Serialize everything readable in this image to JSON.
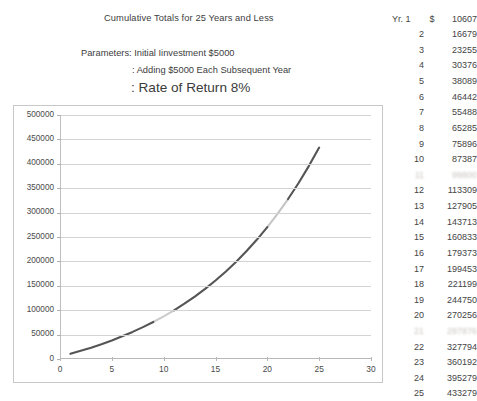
{
  "header": {
    "title": "Cumulative Totals for 25 Years and Less",
    "param_line_1": "Parameters: Initial Iinvestment $5000",
    "param_line_2": ": Adding $5000 Each Subsequent Year",
    "param_line_3": ": Rate of Return 8%"
  },
  "table": {
    "year_label": "Yr. 1",
    "currency_symbol": "$",
    "rows": [
      {
        "year": "1",
        "value": "10607",
        "blurred": false
      },
      {
        "year": "2",
        "value": "16679",
        "blurred": false
      },
      {
        "year": "3",
        "value": "23255",
        "blurred": false
      },
      {
        "year": "4",
        "value": "30376",
        "blurred": false
      },
      {
        "year": "5",
        "value": "38089",
        "blurred": false
      },
      {
        "year": "6",
        "value": "46442",
        "blurred": false
      },
      {
        "year": "7",
        "value": "55488",
        "blurred": false
      },
      {
        "year": "8",
        "value": "65285",
        "blurred": false
      },
      {
        "year": "9",
        "value": "75896",
        "blurred": false
      },
      {
        "year": "10",
        "value": "87387",
        "blurred": false
      },
      {
        "year": "11",
        "value": "99800",
        "blurred": true
      },
      {
        "year": "12",
        "value": "113309",
        "blurred": false
      },
      {
        "year": "13",
        "value": "127905",
        "blurred": false
      },
      {
        "year": "14",
        "value": "143713",
        "blurred": false
      },
      {
        "year": "15",
        "value": "160833",
        "blurred": false
      },
      {
        "year": "16",
        "value": "179373",
        "blurred": false
      },
      {
        "year": "17",
        "value": "199453",
        "blurred": false
      },
      {
        "year": "18",
        "value": "221199",
        "blurred": false
      },
      {
        "year": "19",
        "value": "244750",
        "blurred": false
      },
      {
        "year": "20",
        "value": "270256",
        "blurred": false
      },
      {
        "year": "21",
        "value": "297876",
        "blurred": true
      },
      {
        "year": "22",
        "value": "327794",
        "blurred": false
      },
      {
        "year": "23",
        "value": "360192",
        "blurred": false
      },
      {
        "year": "24",
        "value": "395279",
        "blurred": false
      },
      {
        "year": "25",
        "value": "433279",
        "blurred": false
      }
    ]
  },
  "chart_data": {
    "type": "line",
    "title": "",
    "xlabel": "",
    "ylabel": "",
    "xlim": [
      0,
      30
    ],
    "ylim": [
      0,
      500000
    ],
    "grid": true,
    "legend": "none",
    "line_color": "#555555",
    "y_ticks": [
      0,
      50000,
      100000,
      150000,
      200000,
      250000,
      300000,
      350000,
      400000,
      450000,
      500000
    ],
    "y_tick_labels": [
      "0",
      "50000",
      "100000",
      "150000",
      "200000",
      "250000",
      "300000",
      "350000",
      "400000",
      "450000",
      "500000"
    ],
    "x_ticks": [
      0,
      5,
      10,
      15,
      20,
      25,
      30
    ],
    "x_tick_labels": [
      "0",
      "5",
      "10",
      "15",
      "20",
      "25",
      "30"
    ],
    "series": [
      {
        "name": "Cumulative Total",
        "x": [
          1,
          2,
          3,
          4,
          5,
          6,
          7,
          8,
          9,
          10,
          11,
          12,
          13,
          14,
          15,
          16,
          17,
          18,
          19,
          20,
          21,
          22,
          23,
          24,
          25
        ],
        "values": [
          10607,
          16679,
          23255,
          30376,
          38089,
          46442,
          55488,
          65285,
          75896,
          87387,
          99800,
          113309,
          127905,
          143713,
          160833,
          179373,
          199453,
          221199,
          244750,
          270256,
          297876,
          327794,
          360192,
          395279,
          433279
        ]
      }
    ]
  }
}
